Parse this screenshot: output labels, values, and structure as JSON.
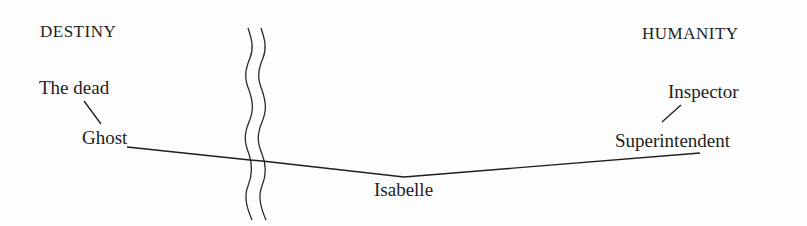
{
  "diagram": {
    "left_heading": "DESTINY",
    "right_heading": "HUMANITY",
    "nodes": {
      "the_dead": "The dead",
      "ghost": "Ghost",
      "isabelle": "Isabelle",
      "inspector": "Inspector",
      "superintendent": "Superintendent"
    },
    "connections": [
      {
        "from": "The dead",
        "to": "Ghost"
      },
      {
        "from": "Ghost",
        "to": "Isabelle"
      },
      {
        "from": "Isabelle",
        "to": "Superintendent"
      },
      {
        "from": "Inspector",
        "to": "Superintendent"
      }
    ],
    "divider": "wavy-double-line",
    "colors": {
      "ink": "#1e1e1e",
      "background": "#fdfdfd"
    }
  }
}
